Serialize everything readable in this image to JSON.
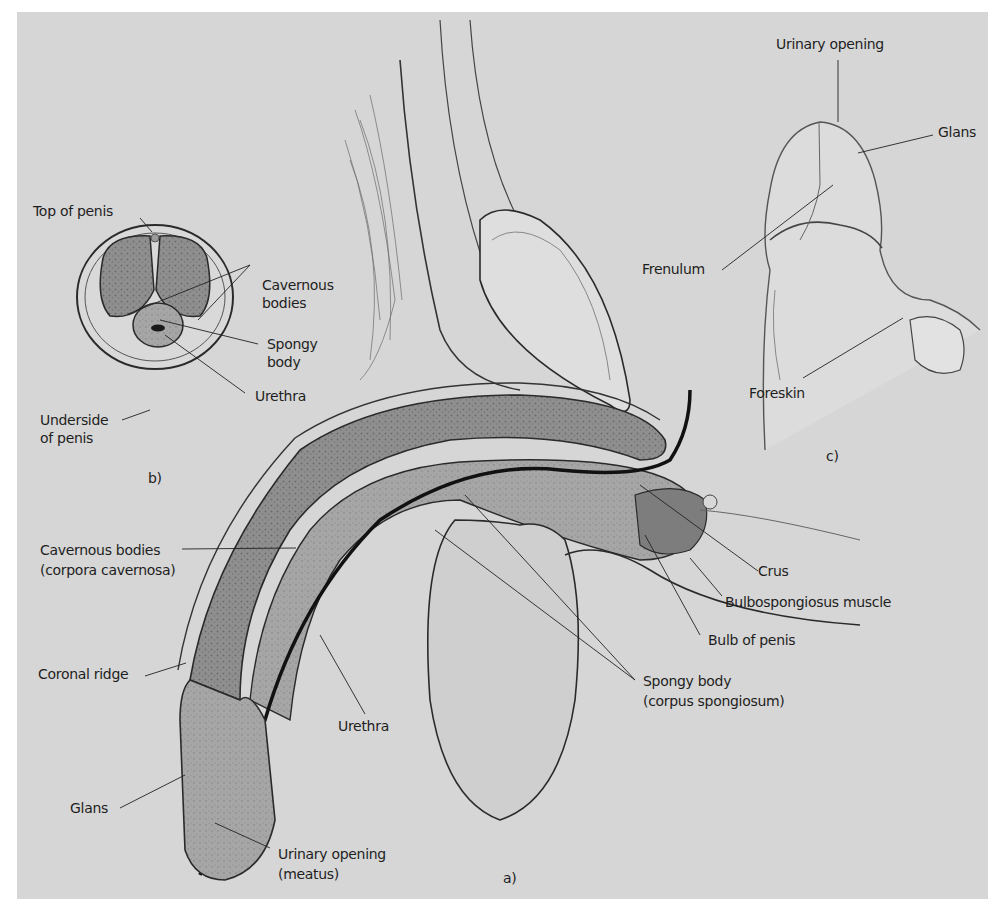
{
  "figure": {
    "panels": {
      "a": {
        "marker": "a)",
        "labels": {
          "cavernous_bodies_l1": "Cavernous bodies",
          "cavernous_bodies_l2": "(corpora cavernosa)",
          "coronal_ridge": "Coronal ridge",
          "urethra": "Urethra",
          "glans": "Glans",
          "urinary_opening_l1": "Urinary opening",
          "urinary_opening_l2": "(meatus)",
          "crus": "Crus",
          "bulbospongiosus": "Bulbospongiosus muscle",
          "bulb_of_penis": "Bulb of penis",
          "spongy_body_l1": "Spongy body",
          "spongy_body_l2": "(corpus spongiosum)"
        }
      },
      "b": {
        "marker": "b)",
        "labels": {
          "top_of_penis": "Top of penis",
          "cavernous_l1": "Cavernous",
          "cavernous_l2": "bodies",
          "spongy_l1": "Spongy",
          "spongy_l2": "body",
          "urethra": "Urethra",
          "underside_l1": "Underside",
          "underside_l2": "of penis"
        }
      },
      "c": {
        "marker": "c)",
        "labels": {
          "urinary_opening": "Urinary opening",
          "glans": "Glans",
          "frenulum": "Frenulum",
          "foreskin": "Foreskin"
        }
      }
    },
    "colors": {
      "background": "#d6d6d6",
      "tissue_dark": "#8c8c8c",
      "tissue_mid": "#a8a8a8",
      "outline": "#2a2a2a",
      "page": "#ffffff"
    }
  }
}
